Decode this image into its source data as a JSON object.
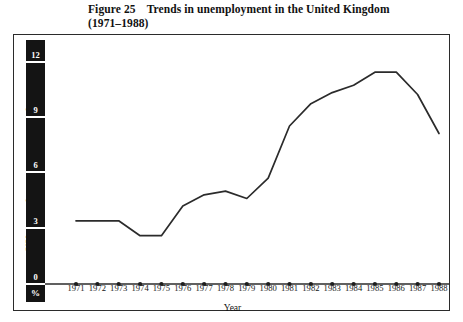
{
  "title": {
    "figure_number": "Figure 25",
    "line1": "Trends in unemployment in the United Kingdom",
    "line2": "(1971–1988)"
  },
  "axes": {
    "y_label": "UK unemployment rate: annual averages",
    "y_unit": "%",
    "y_ticks": [
      "12",
      "9",
      "6",
      "3",
      "0"
    ],
    "x_label": "Year"
  },
  "chart_data": {
    "type": "line",
    "xlabel": "Year",
    "ylabel": "UK unemployment rate: annual averages",
    "yunit": "%",
    "grid": false,
    "legend": null,
    "xlim": [
      1971,
      1988
    ],
    "ylim": [
      0,
      12
    ],
    "yticks": [
      0,
      3,
      6,
      9,
      12
    ],
    "categories": [
      "1971",
      "1972",
      "1973",
      "1974",
      "1975",
      "1976",
      "1977",
      "1978",
      "1979",
      "1980",
      "1981",
      "1982",
      "1983",
      "1984",
      "1985",
      "1986",
      "1987",
      "1988"
    ],
    "series": [
      {
        "name": "UK unemployment rate",
        "values": [
          3.4,
          3.4,
          3.4,
          2.6,
          2.6,
          4.2,
          4.8,
          5.0,
          4.6,
          5.7,
          8.5,
          9.7,
          10.3,
          10.7,
          11.4,
          11.4,
          10.2,
          8.1
        ]
      }
    ]
  },
  "colors": {
    "line": "#2b2b2b",
    "axis_bar": "#141414",
    "frame": "#2b2b2b",
    "background": "#ffffff"
  }
}
